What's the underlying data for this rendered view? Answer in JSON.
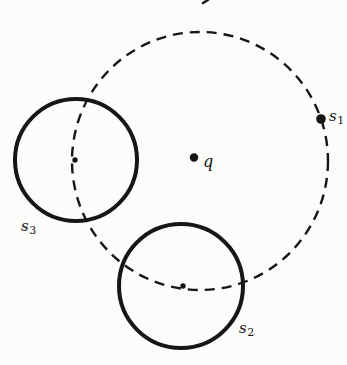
{
  "colors": {
    "ink": "#161616",
    "background": "#fcfcfb"
  },
  "labels": {
    "q": {
      "base": "q"
    },
    "s1": {
      "base": "s",
      "sub": "1"
    },
    "s2": {
      "base": "s",
      "sub": "2"
    },
    "s3": {
      "base": "s",
      "sub": "3"
    }
  },
  "geometry": {
    "dashed_circle": {
      "cx": 200,
      "cy": 161,
      "rx": 128,
      "ry": 129,
      "stroke-dasharray": "10 7",
      "stroke-width": 2.4
    },
    "s3_circle": {
      "cx": 76,
      "cy": 160,
      "r": 61,
      "stroke-width": 4
    },
    "s2_circle": {
      "cx": 181,
      "cy": 286,
      "r": 62,
      "stroke-width": 4
    },
    "q_dot": {
      "cx": 194,
      "cy": 157.5,
      "r": 4.2
    },
    "s1_dot": {
      "cx": 321,
      "cy": 119,
      "r": 4.8
    },
    "s3_center_dot": {
      "cx": 75,
      "cy": 160,
      "r": 2.7
    },
    "s2_center_dot": {
      "cx": 183,
      "cy": 286,
      "r": 2.7
    },
    "top_artifact": {
      "x1": 203,
      "y1": 3,
      "x2": 208,
      "y2": 0
    }
  }
}
